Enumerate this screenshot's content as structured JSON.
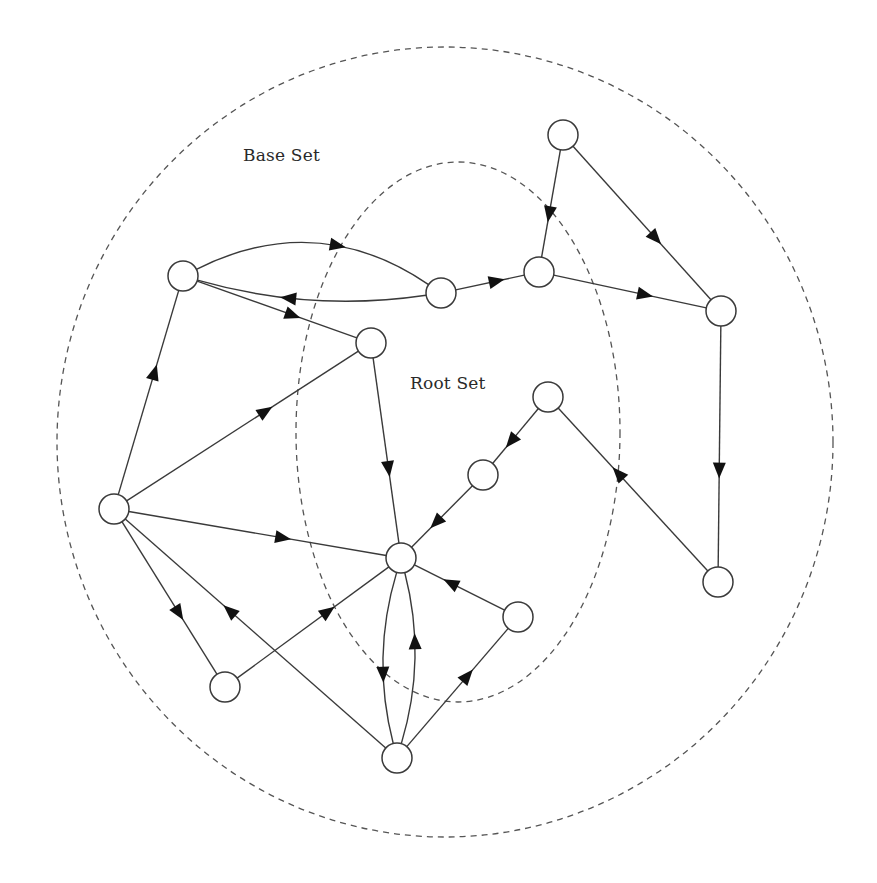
{
  "labels": {
    "base_set": "Base Set",
    "root_set": "Root Set"
  },
  "colors": {
    "stroke": "#3a3a3a",
    "arrow": "#111111",
    "dashed": "#555555",
    "node_fill": "#ffffff"
  },
  "regions": {
    "base_set": {
      "cx": 445,
      "cy": 442,
      "rx": 388,
      "ry": 395
    },
    "root_set": {
      "cx": 458,
      "cy": 432,
      "rx": 162,
      "ry": 270
    }
  },
  "node_radius": 15,
  "nodes": [
    {
      "id": "n1",
      "x": 563,
      "y": 135,
      "set": "base"
    },
    {
      "id": "n2",
      "x": 183,
      "y": 276,
      "set": "base"
    },
    {
      "id": "n3",
      "x": 441,
      "y": 293,
      "set": "root"
    },
    {
      "id": "n4",
      "x": 539,
      "y": 272,
      "set": "root"
    },
    {
      "id": "n5",
      "x": 721,
      "y": 311,
      "set": "base"
    },
    {
      "id": "n6",
      "x": 371,
      "y": 343,
      "set": "root"
    },
    {
      "id": "n7",
      "x": 548,
      "y": 397,
      "set": "root"
    },
    {
      "id": "n8",
      "x": 483,
      "y": 475,
      "set": "root"
    },
    {
      "id": "n9",
      "x": 114,
      "y": 509,
      "set": "base"
    },
    {
      "id": "n10",
      "x": 401,
      "y": 558,
      "set": "root"
    },
    {
      "id": "n11",
      "x": 518,
      "y": 617,
      "set": "root"
    },
    {
      "id": "n12",
      "x": 718,
      "y": 582,
      "set": "base"
    },
    {
      "id": "n13",
      "x": 225,
      "y": 687,
      "set": "base"
    },
    {
      "id": "n14",
      "x": 397,
      "y": 758,
      "set": "base"
    }
  ],
  "edges": [
    {
      "from": "n1",
      "to": "n4",
      "curve": 0
    },
    {
      "from": "n1",
      "to": "n5",
      "curve": 0
    },
    {
      "from": "n3",
      "to": "n4",
      "curve": 0
    },
    {
      "from": "n4",
      "to": "n5",
      "curve": 0
    },
    {
      "from": "n2",
      "to": "n3",
      "curve": -38
    },
    {
      "from": "n3",
      "to": "n2",
      "curve": -14
    },
    {
      "from": "n2",
      "to": "n6",
      "curve": 0
    },
    {
      "from": "n9",
      "to": "n2",
      "curve": 0
    },
    {
      "from": "n9",
      "to": "n6",
      "curve": 0
    },
    {
      "from": "n6",
      "to": "n10",
      "curve": 0
    },
    {
      "from": "n9",
      "to": "n10",
      "curve": 0
    },
    {
      "from": "n7",
      "to": "n8",
      "curve": 0
    },
    {
      "from": "n8",
      "to": "n10",
      "curve": 0
    },
    {
      "from": "n12",
      "to": "n7",
      "curve": 0
    },
    {
      "from": "n5",
      "to": "n12",
      "curve": 0
    },
    {
      "from": "n11",
      "to": "n10",
      "curve": 0
    },
    {
      "from": "n9",
      "to": "n13",
      "curve": 0
    },
    {
      "from": "n14",
      "to": "n9",
      "curve": 0
    },
    {
      "from": "n13",
      "to": "n10",
      "curve": 0
    },
    {
      "from": "n10",
      "to": "n14",
      "curve": 14
    },
    {
      "from": "n14",
      "to": "n10",
      "curve": 14
    },
    {
      "from": "n14",
      "to": "n11",
      "curve": 0
    }
  ]
}
